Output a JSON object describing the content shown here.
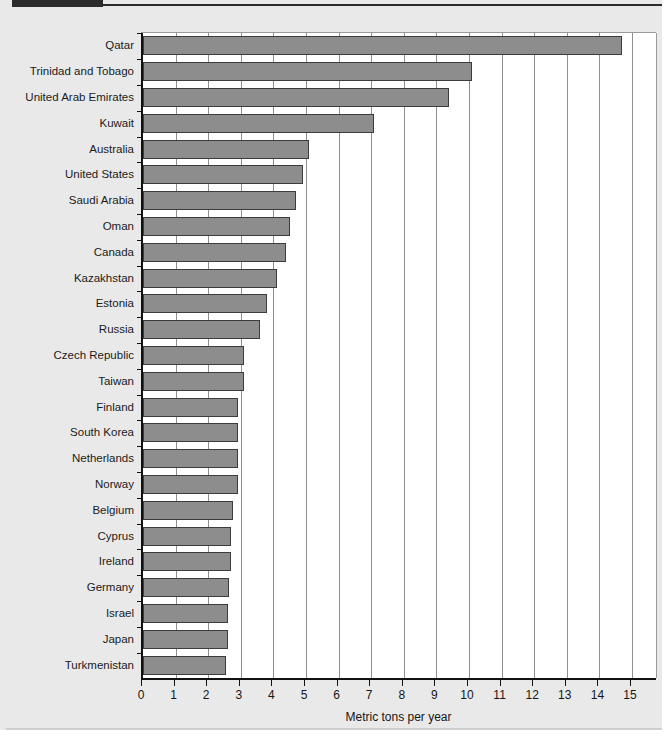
{
  "figure": {
    "tab_label": "",
    "title": ""
  },
  "chart_data": {
    "type": "bar",
    "orientation": "horizontal",
    "title": "",
    "xlabel": "Metric tons per year",
    "ylabel": "",
    "xlim": [
      0,
      15
    ],
    "xticks": [
      "0",
      "1",
      "2",
      "3",
      "4",
      "5",
      "6",
      "7",
      "8",
      "9",
      "10",
      "11",
      "12",
      "13",
      "14",
      "15"
    ],
    "grid": "vertical",
    "legend": "none",
    "bar_color": "#8d8d8d",
    "bar_edge_color": "#3c3c3c",
    "plot_background": "#ffffff",
    "figure_background": "#e9e9e9",
    "categories": [
      "Qatar",
      "Trinidad and Tobago",
      "United Arab Emirates",
      "Kuwait",
      "Australia",
      "United States",
      "Saudi Arabia",
      "Oman",
      "Canada",
      "Kazakhstan",
      "Estonia",
      "Russia",
      "Czech Republic",
      "Taiwan",
      "Finland",
      "South Korea",
      "Netherlands",
      "Norway",
      "Belgium",
      "Cyprus",
      "Ireland",
      "Germany",
      "Israel",
      "Japan",
      "Turkmenistan"
    ],
    "values": [
      14.7,
      10.1,
      9.4,
      7.1,
      5.1,
      4.9,
      4.7,
      4.5,
      4.4,
      4.1,
      3.8,
      3.6,
      3.1,
      3.1,
      2.9,
      2.9,
      2.9,
      2.9,
      2.75,
      2.7,
      2.7,
      2.65,
      2.6,
      2.6,
      2.55
    ]
  }
}
